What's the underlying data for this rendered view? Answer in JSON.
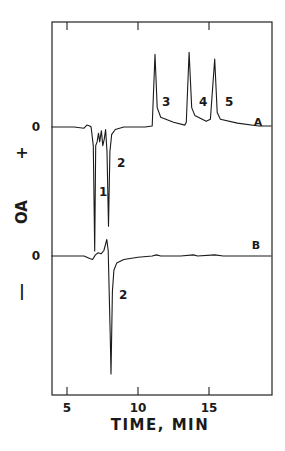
{
  "chart_data": {
    "type": "line",
    "title": "",
    "xlabel": "TIME, MIN",
    "ylabel": "OA",
    "ylabel_positive": "+",
    "ylabel_negative": "−",
    "xlim": [
      3.9,
      19.4
    ],
    "xticks": [
      5,
      10,
      15
    ],
    "xtick_labels": [
      "5",
      "10",
      "15"
    ],
    "grid": false,
    "legend": "none",
    "series": [
      {
        "name": "A",
        "zero_label": "0",
        "baseline_relative": 0,
        "peaks": [
          {
            "label": "1",
            "time_min": 7.0,
            "direction": "negative",
            "relative_height": -1.0
          },
          {
            "label": "2",
            "time_min": 7.9,
            "direction": "negative",
            "relative_height": -0.8
          },
          {
            "label": "3",
            "time_min": 11.2,
            "direction": "positive",
            "relative_height": 0.75
          },
          {
            "label": "4",
            "time_min": 13.6,
            "direction": "positive",
            "relative_height": 0.77
          },
          {
            "label": "5",
            "time_min": 15.4,
            "direction": "positive",
            "relative_height": 0.7
          }
        ],
        "points": [
          [
            3.9,
            0
          ],
          [
            5.5,
            0
          ],
          [
            6.2,
            -0.01
          ],
          [
            6.4,
            0.02
          ],
          [
            6.6,
            0.01
          ],
          [
            6.7,
            0
          ],
          [
            6.85,
            -0.15
          ],
          [
            6.95,
            -1.0
          ],
          [
            7.02,
            -0.15
          ],
          [
            7.12,
            -0.12
          ],
          [
            7.22,
            -0.05
          ],
          [
            7.3,
            -0.12
          ],
          [
            7.42,
            -0.03
          ],
          [
            7.52,
            -0.15
          ],
          [
            7.62,
            -0.1
          ],
          [
            7.72,
            -0.02
          ],
          [
            7.82,
            -0.2
          ],
          [
            7.92,
            -0.8
          ],
          [
            8.02,
            -0.2
          ],
          [
            8.15,
            -0.06
          ],
          [
            8.4,
            -0.02
          ],
          [
            9.0,
            0
          ],
          [
            10.5,
            0
          ],
          [
            11.0,
            0.01
          ],
          [
            11.2,
            0.75
          ],
          [
            11.35,
            0.2
          ],
          [
            11.6,
            0.1
          ],
          [
            12.5,
            0.05
          ],
          [
            13.3,
            0.02
          ],
          [
            13.4,
            0.05
          ],
          [
            13.6,
            0.77
          ],
          [
            13.78,
            0.2
          ],
          [
            14.0,
            0.12
          ],
          [
            14.8,
            0.06
          ],
          [
            15.1,
            0.08
          ],
          [
            15.4,
            0.7
          ],
          [
            15.58,
            0.15
          ],
          [
            15.8,
            0.08
          ],
          [
            17.0,
            0.04
          ],
          [
            18.5,
            0.01
          ],
          [
            19.4,
            0.01
          ]
        ]
      },
      {
        "name": "B",
        "zero_label": "0",
        "baseline_relative": 0,
        "peaks": [
          {
            "label": "2",
            "time_min": 8.1,
            "direction": "negative",
            "relative_height": -1.0
          }
        ],
        "points": [
          [
            3.9,
            0
          ],
          [
            6.2,
            0
          ],
          [
            6.6,
            -0.02
          ],
          [
            6.8,
            -0.03
          ],
          [
            7.0,
            0.01
          ],
          [
            7.2,
            0.03
          ],
          [
            7.4,
            0.02
          ],
          [
            7.6,
            0.05
          ],
          [
            7.8,
            0.15
          ],
          [
            7.9,
            0.05
          ],
          [
            8.05,
            -0.7
          ],
          [
            8.1,
            -1.0
          ],
          [
            8.2,
            -0.3
          ],
          [
            8.3,
            -0.12
          ],
          [
            8.5,
            -0.06
          ],
          [
            9.0,
            -0.03
          ],
          [
            10.0,
            -0.01
          ],
          [
            11.0,
            0
          ],
          [
            11.3,
            0.01
          ],
          [
            11.6,
            0
          ],
          [
            13.0,
            0
          ],
          [
            13.9,
            0.01
          ],
          [
            14.2,
            0
          ],
          [
            15.4,
            0.01
          ],
          [
            16.0,
            0
          ],
          [
            19.4,
            0
          ]
        ]
      }
    ]
  }
}
